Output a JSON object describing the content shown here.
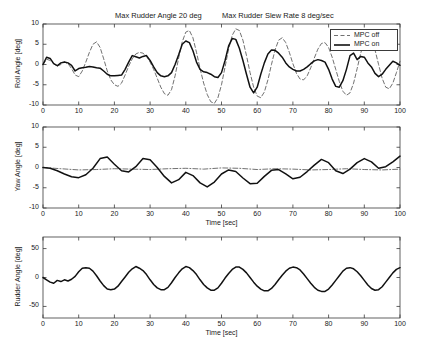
{
  "figure": {
    "width": 424,
    "height": 345,
    "background": "#ffffff",
    "titles": [
      {
        "text": "Max Rudder Angle 20 deg",
        "x": 115,
        "y": 11
      },
      {
        "text": "Max Rudder Slew Rate 8 deg/sec",
        "x": 222,
        "y": 11
      }
    ]
  },
  "legend": {
    "entries": [
      {
        "label": "MPC off",
        "style": "dashed",
        "color": "#4d4d4d"
      },
      {
        "label": "MPC on",
        "style": "solid",
        "color": "#111111"
      }
    ]
  },
  "chart_data": [
    {
      "type": "line",
      "id": "roll-angle",
      "title": "Max Rudder Angle 20 deg    Max Rudder Slew Rate 8 deg/sec",
      "xlabel": "",
      "ylabel": "Roll Angle [deg]",
      "xlim": [
        0,
        100
      ],
      "ylim": [
        -10,
        10
      ],
      "xticks": [
        0,
        10,
        20,
        30,
        40,
        50,
        60,
        70,
        80,
        90,
        100
      ],
      "yticks": [
        -10,
        -5,
        0,
        5,
        10
      ],
      "grid": false,
      "legend_position": "upper-right",
      "series": [
        {
          "name": "MPC off",
          "style": "dashed",
          "color": "#4d4d4d",
          "x": [
            0,
            1,
            2,
            3,
            4,
            5,
            6,
            7,
            8,
            9,
            10,
            11,
            12,
            13,
            14,
            15,
            16,
            17,
            18,
            19,
            20,
            21,
            22,
            23,
            24,
            25,
            26,
            27,
            28,
            29,
            30,
            31,
            32,
            33,
            34,
            35,
            36,
            37,
            38,
            39,
            40,
            41,
            42,
            43,
            44,
            45,
            46,
            47,
            48,
            49,
            50,
            51,
            52,
            53,
            54,
            55,
            56,
            57,
            58,
            59,
            60,
            61,
            62,
            63,
            64,
            65,
            66,
            67,
            68,
            69,
            70,
            71,
            72,
            73,
            74,
            75,
            76,
            77,
            78,
            79,
            80,
            81,
            82,
            83,
            84,
            85,
            86,
            87,
            88,
            89,
            90,
            91,
            92,
            93,
            94,
            95,
            96,
            97,
            98,
            99,
            100
          ],
          "y": [
            0,
            1.3,
            1.0,
            0.2,
            -0.4,
            0.0,
            0.6,
            0.2,
            -1.0,
            -2.6,
            -3.0,
            -1.6,
            0.6,
            3.0,
            5.0,
            5.6,
            4.2,
            1.4,
            -1.6,
            -3.8,
            -5.0,
            -5.4,
            -4.6,
            -2.6,
            -0.4,
            1.4,
            2.6,
            3.0,
            2.8,
            2.0,
            0.6,
            -1.2,
            -3.4,
            -5.6,
            -7.2,
            -7.6,
            -6.2,
            -2.8,
            1.6,
            5.6,
            8.0,
            8.4,
            6.6,
            3.0,
            -1.0,
            -4.6,
            -7.4,
            -9.2,
            -9.6,
            -8.2,
            -5.0,
            -0.6,
            3.8,
            7.2,
            8.8,
            8.4,
            6.0,
            2.2,
            -2.0,
            -5.6,
            -7.8,
            -8.2,
            -6.8,
            -3.8,
            0.0,
            3.6,
            6.0,
            6.6,
            5.4,
            3.0,
            0.2,
            -2.2,
            -3.6,
            -3.8,
            -2.8,
            -0.8,
            1.6,
            3.8,
            5.2,
            5.4,
            4.2,
            1.8,
            -1.2,
            -4.2,
            -6.6,
            -7.6,
            -7.0,
            -4.6,
            -1.0,
            2.8,
            5.8,
            7.0,
            6.2,
            3.6,
            0.0,
            -3.4,
            -5.6,
            -6.0,
            -4.6,
            -2.0,
            0.8,
            2.6
          ]
        },
        {
          "name": "MPC on",
          "style": "solid",
          "color": "#111111",
          "x": [
            0,
            1,
            2,
            3,
            4,
            5,
            6,
            7,
            8,
            9,
            10,
            11,
            12,
            13,
            14,
            15,
            16,
            17,
            18,
            19,
            20,
            21,
            22,
            23,
            24,
            25,
            26,
            27,
            28,
            29,
            30,
            31,
            32,
            33,
            34,
            35,
            36,
            37,
            38,
            39,
            40,
            41,
            42,
            43,
            44,
            45,
            46,
            47,
            48,
            49,
            50,
            51,
            52,
            53,
            54,
            55,
            56,
            57,
            58,
            59,
            60,
            61,
            62,
            63,
            64,
            65,
            66,
            67,
            68,
            69,
            70,
            71,
            72,
            73,
            74,
            75,
            76,
            77,
            78,
            79,
            80,
            81,
            82,
            83,
            84,
            85,
            86,
            87,
            88,
            89,
            90,
            91,
            92,
            93,
            94,
            95,
            96,
            97,
            98,
            99,
            100
          ],
          "y": [
            0,
            1.8,
            1.5,
            0.2,
            -0.3,
            0.4,
            0.6,
            0.4,
            -0.2,
            -1.6,
            -1.0,
            -0.8,
            -0.7,
            -0.5,
            -0.6,
            -0.8,
            -0.9,
            -1.6,
            -2.4,
            -2.8,
            -2.8,
            -2.7,
            -2.6,
            -1.2,
            0.6,
            2.2,
            1.9,
            1.6,
            2.0,
            2.2,
            1.0,
            -0.6,
            -2.0,
            -2.8,
            -3.0,
            -2.8,
            -2.0,
            0.0,
            2.4,
            5.0,
            5.8,
            5.4,
            3.4,
            0.6,
            -1.2,
            -1.8,
            -2.0,
            -2.4,
            -3.0,
            -3.2,
            -2.0,
            1.0,
            4.6,
            6.4,
            6.2,
            4.0,
            1.0,
            -2.4,
            -5.6,
            -7.0,
            -5.6,
            -2.4,
            0.4,
            2.6,
            3.6,
            3.5,
            2.8,
            1.8,
            0.4,
            -0.6,
            -1.2,
            -1.6,
            -1.6,
            -1.2,
            -0.6,
            0.2,
            0.9,
            1.2,
            1.0,
            0.6,
            -1.2,
            -3.6,
            -5.4,
            -5.6,
            -4.0,
            -1.2,
            2.2,
            2.8,
            1.2,
            2.0,
            1.8,
            0.4,
            -0.6,
            -2.2,
            -3.0,
            -2.4,
            -1.2,
            -0.2,
            0.8,
            0.4,
            -0.2
          ]
        }
      ]
    },
    {
      "type": "line",
      "id": "yaw-angle",
      "title": "",
      "xlabel": "Time [sec]",
      "ylabel": "Yaw Angle [deg]",
      "xlim": [
        0,
        100
      ],
      "ylim": [
        -10,
        10
      ],
      "xticks": [
        0,
        10,
        20,
        30,
        40,
        50,
        60,
        70,
        80,
        90,
        100
      ],
      "yticks": [
        -10,
        -5,
        0,
        5,
        10
      ],
      "grid": false,
      "series": [
        {
          "name": "MPC off",
          "style": "dashdot",
          "color": "#4d4d4d",
          "x": [
            0,
            5,
            10,
            15,
            20,
            25,
            30,
            35,
            40,
            45,
            50,
            55,
            60,
            65,
            70,
            75,
            80,
            85,
            90,
            95,
            100
          ],
          "y": [
            0,
            -0.3,
            -0.6,
            -0.5,
            -0.3,
            -0.4,
            -0.5,
            -0.3,
            -0.2,
            -0.4,
            -0.1,
            -0.2,
            -0.5,
            -0.3,
            -0.4,
            -0.6,
            -0.5,
            -0.3,
            -0.5,
            -0.6,
            -0.4
          ]
        },
        {
          "name": "MPC on",
          "style": "solid",
          "color": "#111111",
          "x": [
            0,
            2,
            4,
            6,
            8,
            10,
            12,
            14,
            16,
            18,
            20,
            22,
            24,
            26,
            28,
            30,
            32,
            34,
            36,
            38,
            40,
            42,
            44,
            46,
            48,
            50,
            52,
            54,
            56,
            58,
            60,
            62,
            64,
            66,
            68,
            70,
            72,
            74,
            76,
            78,
            80,
            82,
            84,
            86,
            88,
            90,
            92,
            94,
            96,
            98,
            100
          ],
          "y": [
            0,
            -0.2,
            -0.8,
            -1.6,
            -2.3,
            -2.5,
            -1.8,
            -0.2,
            2.2,
            2.6,
            0.8,
            -0.8,
            -1.1,
            0.2,
            2.2,
            1.9,
            0.0,
            -2.2,
            -3.8,
            -3.0,
            -1.2,
            -2.0,
            -3.8,
            -4.8,
            -3.6,
            -1.6,
            -0.6,
            -1.0,
            -2.6,
            -4.0,
            -3.9,
            -2.2,
            -0.7,
            -0.5,
            -1.6,
            -2.8,
            -2.4,
            -1.0,
            0.6,
            2.0,
            1.2,
            -0.8,
            -1.5,
            -0.4,
            1.2,
            2.2,
            1.4,
            -0.2,
            0.2,
            1.4,
            2.8
          ]
        }
      ]
    },
    {
      "type": "line",
      "id": "rudder-angle",
      "title": "",
      "xlabel": "Time [sec]",
      "ylabel": "Rudder Angle [deg]",
      "xlim": [
        0,
        100
      ],
      "ylim": [
        -70,
        70
      ],
      "xticks": [
        0,
        10,
        20,
        30,
        40,
        50,
        60,
        70,
        80,
        90,
        100
      ],
      "yticks": [
        -50,
        0,
        50
      ],
      "grid": false,
      "series": [
        {
          "name": "Rudder",
          "style": "solid",
          "color": "#111111",
          "x": [
            0,
            1,
            2,
            3,
            4,
            5,
            6,
            7,
            8,
            9,
            10,
            11,
            12,
            13,
            14,
            15,
            16,
            17,
            18,
            19,
            20,
            21,
            22,
            23,
            24,
            25,
            26,
            27,
            28,
            29,
            30,
            31,
            32,
            33,
            34,
            35,
            36,
            37,
            38,
            39,
            40,
            41,
            42,
            43,
            44,
            45,
            46,
            47,
            48,
            49,
            50,
            51,
            52,
            53,
            54,
            55,
            56,
            57,
            58,
            59,
            60,
            61,
            62,
            63,
            64,
            65,
            66,
            67,
            68,
            69,
            70,
            71,
            72,
            73,
            74,
            75,
            76,
            77,
            78,
            79,
            80,
            81,
            82,
            83,
            84,
            85,
            86,
            87,
            88,
            89,
            90,
            91,
            92,
            93,
            94,
            95,
            96,
            97,
            98,
            99,
            100
          ],
          "y": [
            0,
            -4,
            -8,
            -10,
            -5,
            -7,
            -4,
            -6,
            -3,
            2,
            10,
            16,
            17,
            16,
            11,
            3,
            -6,
            -14,
            -20,
            -21,
            -20,
            -15,
            -7,
            1,
            9,
            15,
            19,
            16,
            12,
            5,
            -4,
            -12,
            -18,
            -21,
            -21,
            -17,
            -9,
            0,
            8,
            15,
            19,
            17,
            12,
            5,
            -4,
            -12,
            -18,
            -22,
            -22,
            -18,
            -10,
            -1,
            7,
            14,
            18,
            18,
            14,
            8,
            0,
            -8,
            -15,
            -20,
            -23,
            -23,
            -19,
            -12,
            -4,
            4,
            11,
            16,
            18,
            17,
            13,
            6,
            -2,
            -10,
            -17,
            -22,
            -24,
            -24,
            -20,
            -13,
            -5,
            3,
            11,
            16,
            17,
            15,
            10,
            3,
            -5,
            -13,
            -19,
            -22,
            -21,
            -16,
            -8,
            0,
            8,
            14,
            17,
            16,
            7,
            -2
          ]
        }
      ]
    }
  ],
  "axes_geometry": [
    {
      "id": "roll-angle",
      "left": 43,
      "top": 24,
      "width": 357,
      "height": 81
    },
    {
      "id": "yaw-angle",
      "left": 43,
      "top": 127,
      "width": 357,
      "height": 81
    },
    {
      "id": "rudder-angle",
      "left": 43,
      "top": 237,
      "width": 357,
      "height": 81
    }
  ]
}
